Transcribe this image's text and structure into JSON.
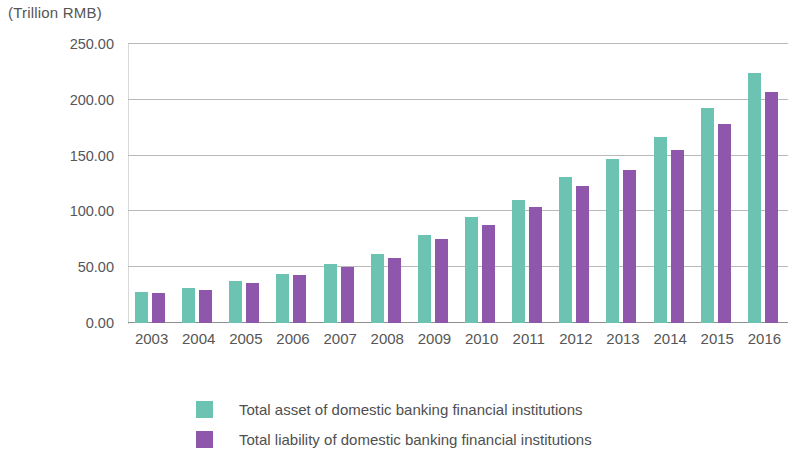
{
  "unit_caption": "(Trillion RMB)",
  "colors": {
    "asset": "#6dc3b2",
    "liability": "#8e57ac",
    "gridline": "#b9b9b9",
    "text": "#565656",
    "background": "#ffffff"
  },
  "legend": {
    "items": [
      {
        "label": "Total asset of domestic banking financial institutions",
        "color": "#6dc3b2"
      },
      {
        "label": "Total liability of domestic banking financial institutions",
        "color": "#8e57ac"
      }
    ]
  },
  "axis": {
    "y_tick_labels": [
      "250.00",
      "200.00",
      "150.00",
      "100.00",
      "50.00",
      "0.00"
    ],
    "x_tick_labels": [
      "2003",
      "2004",
      "2005",
      "2006",
      "2007",
      "2008",
      "2009",
      "2010",
      "2011",
      "2012",
      "2013",
      "2014",
      "2015",
      "2016"
    ]
  },
  "chart_data": {
    "type": "bar",
    "title": "",
    "subtitle": "",
    "xlabel": "",
    "ylabel": "(Trillion RMB)",
    "ylim": [
      0,
      250
    ],
    "ytick_step": 50,
    "grid": true,
    "legend_position": "bottom",
    "categories": [
      "2003",
      "2004",
      "2005",
      "2006",
      "2007",
      "2008",
      "2009",
      "2010",
      "2011",
      "2012",
      "2013",
      "2014",
      "2015",
      "2016"
    ],
    "series": [
      {
        "name": "Total asset of domestic banking financial institutions",
        "color": "#6dc3b2",
        "values": [
          28,
          31,
          38,
          44,
          53,
          62,
          79,
          95,
          110,
          131,
          147,
          167,
          193,
          224
        ]
      },
      {
        "name": "Total liability of domestic banking financial institutions",
        "color": "#8e57ac",
        "values": [
          27,
          30,
          36,
          43,
          50,
          58,
          75,
          88,
          104,
          123,
          137,
          155,
          178,
          207
        ]
      }
    ]
  }
}
